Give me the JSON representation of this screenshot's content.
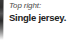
{
  "caption": {
    "kicker": "Top right:",
    "title": "Single jersey."
  },
  "colors": {
    "background": "#ffffff",
    "kicker_text": "#4b4b4b",
    "title_text": "#1b1b1b",
    "edge_strip_dark": "#2e2e2e"
  }
}
